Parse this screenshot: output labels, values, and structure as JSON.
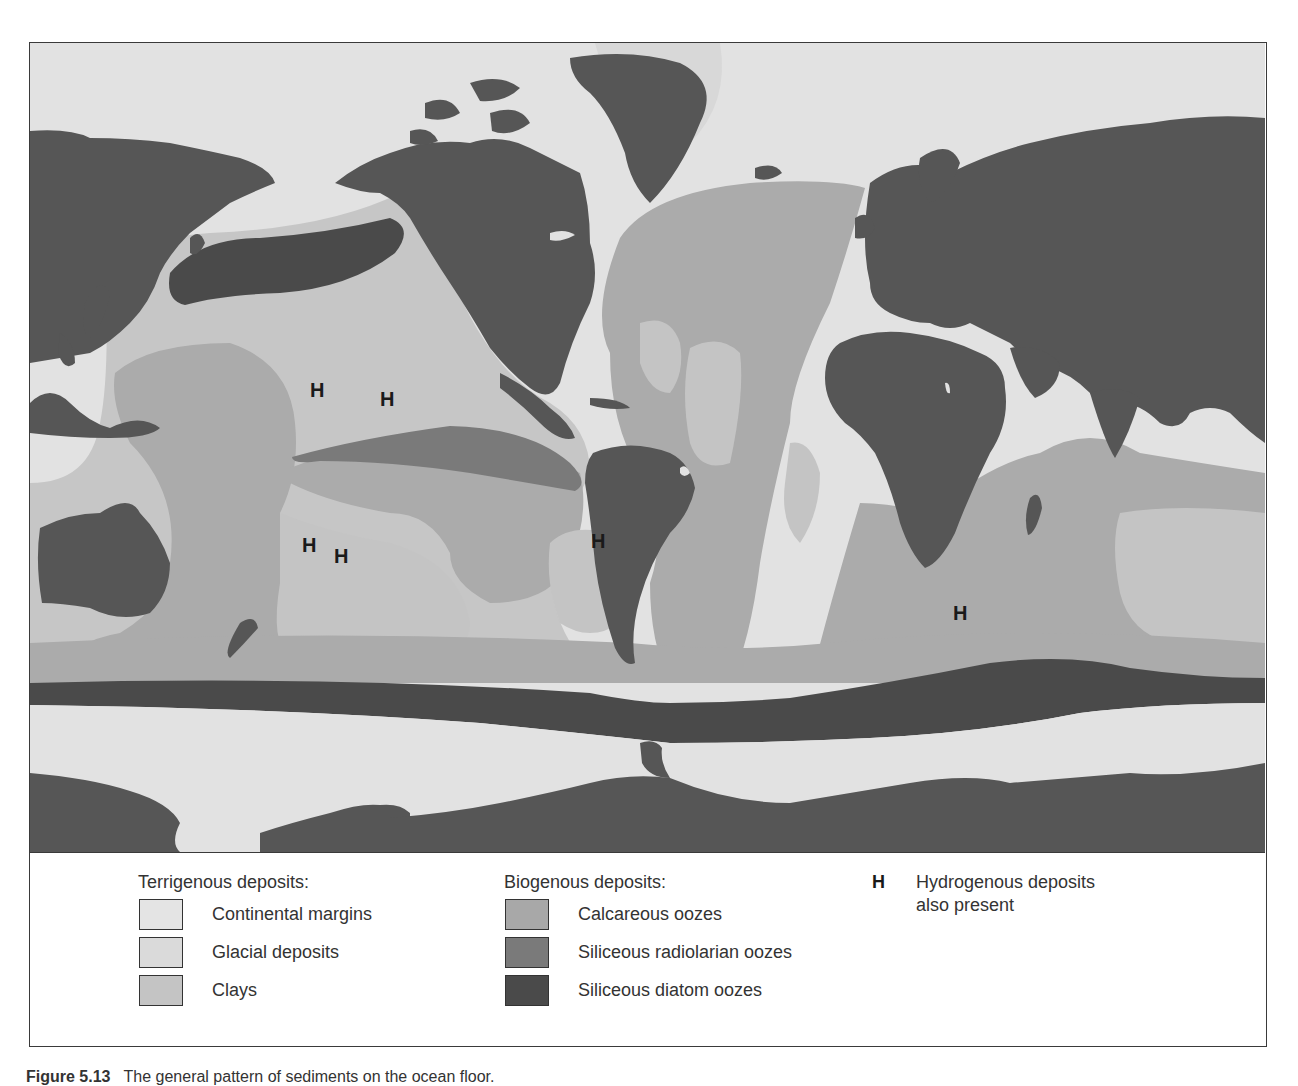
{
  "figure": {
    "caption_label": "Figure 5.13",
    "caption_text": "The general pattern of sediments on the ocean floor."
  },
  "colors": {
    "land": "#565656",
    "continental_margins": "#e4e4e4",
    "glacial_deposits": "#dadada",
    "clays": "#c4c4c4",
    "calcareous_oozes": "#a8a8a8",
    "siliceous_radiolarian_oozes": "#7a7a7a",
    "siliceous_diatom_oozes": "#4a4a4a",
    "frame": "#3a3a3a"
  },
  "legend": {
    "terrigenous": {
      "title": "Terrigenous deposits:",
      "items": [
        {
          "label": "Continental margins",
          "color": "#e4e4e4"
        },
        {
          "label": "Glacial deposits",
          "color": "#dadada"
        },
        {
          "label": "Clays",
          "color": "#c4c4c4"
        }
      ]
    },
    "biogenous": {
      "title": "Biogenous deposits:",
      "items": [
        {
          "label": "Calcareous oozes",
          "color": "#a8a8a8"
        },
        {
          "label": "Siliceous radiolarian oozes",
          "color": "#7a7a7a"
        },
        {
          "label": "Siliceous diatom oozes",
          "color": "#4a4a4a"
        }
      ]
    },
    "hydrogenous": {
      "symbol": "H",
      "line1": "Hydrogenous deposits",
      "line2": "also present"
    }
  },
  "map": {
    "h_markers": [
      {
        "label": "H",
        "x": 280,
        "y": 337
      },
      {
        "label": "H",
        "x": 350,
        "y": 346
      },
      {
        "label": "H",
        "x": 272,
        "y": 492
      },
      {
        "label": "H",
        "x": 304,
        "y": 503
      },
      {
        "label": "H",
        "x": 561,
        "y": 488
      },
      {
        "label": "H",
        "x": 923,
        "y": 560
      }
    ]
  }
}
